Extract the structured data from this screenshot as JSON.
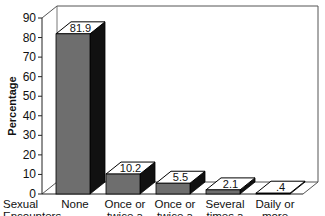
{
  "chart_data": {
    "type": "bar",
    "style": "3d",
    "title": "",
    "xlabel": "Sexual Encounters",
    "ylabel": "Percentage",
    "ylim": [
      0,
      90
    ],
    "yticks": [
      0,
      10,
      20,
      30,
      40,
      50,
      60,
      70,
      80,
      90
    ],
    "grid": false,
    "legend": null,
    "categories": [
      [
        "None"
      ],
      [
        "Once or",
        "twice a",
        "month"
      ],
      [
        "Once or",
        "twice a",
        "week"
      ],
      [
        "Several",
        "times a",
        "week"
      ],
      [
        "Daily or",
        "more",
        "often"
      ]
    ],
    "values": [
      81.9,
      10.2,
      5.5,
      2.1,
      0.4
    ],
    "value_labels": [
      "81.9",
      "10.2",
      "5.5",
      "2.1",
      ".4"
    ],
    "colors": {
      "bar_front": "#6e6e6e",
      "bar_top": "#ffffff",
      "bar_side": "#111111",
      "axis": "#222222"
    }
  }
}
